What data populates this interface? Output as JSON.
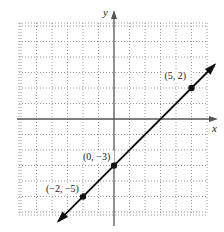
{
  "chart_data": {
    "type": "line",
    "title": "",
    "xlabel": "x",
    "ylabel": "y",
    "xlim": [
      -6,
      6
    ],
    "ylim": [
      -6,
      6
    ],
    "grid": true,
    "grid_style": "dotted",
    "unit_step": 1,
    "series": [
      {
        "name": "line y = x - 3",
        "slope": 1,
        "intercept": -3,
        "arrows": "both",
        "x": [
          -2,
          0,
          5
        ],
        "y": [
          -5,
          -3,
          2
        ]
      }
    ],
    "points": [
      {
        "x": 5,
        "y": 2,
        "label": "(5, 2)"
      },
      {
        "x": 0,
        "y": -3,
        "label": "(0, −3)"
      },
      {
        "x": -2,
        "y": -5,
        "label": "(−2, −5)"
      }
    ],
    "colors": {
      "line": "#111111",
      "grid": "#9a9a9a",
      "axis": "#555555"
    }
  },
  "labels": {
    "x_axis": "x",
    "y_axis": "y",
    "p1": "(5, 2)",
    "p2": "(0, −3)",
    "p3": "(−2, −5)"
  }
}
